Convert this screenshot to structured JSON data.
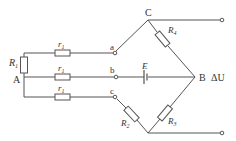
{
  "diagram": {
    "type": "circuit",
    "nodes": {
      "A": "A",
      "B": "B",
      "C": "C",
      "a": "a",
      "b": "b",
      "c": "c"
    },
    "components": {
      "R1": {
        "symbol": "R",
        "sub": "1"
      },
      "r1_top": {
        "symbol": "r",
        "sub": "1"
      },
      "r1_mid": {
        "symbol": "r",
        "sub": "1"
      },
      "r1_bot": {
        "symbol": "r",
        "sub": "1"
      },
      "R2": {
        "symbol": "R",
        "sub": "2"
      },
      "R3": {
        "symbol": "R",
        "sub": "3"
      },
      "R4": {
        "symbol": "R",
        "sub": "4"
      },
      "E": "E"
    },
    "output_label": "ΔU",
    "colors": {
      "line": "#555555",
      "text": "#333333"
    }
  }
}
